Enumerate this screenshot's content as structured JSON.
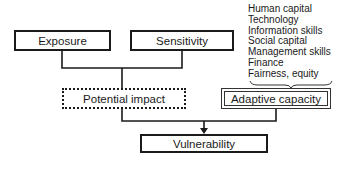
{
  "diagram": {
    "nodes": {
      "exposure": "Exposure",
      "sensitivity": "Sensitivity",
      "potential_impact": "Potential impact",
      "adaptive_capacity": "Adaptive capacity",
      "vulnerability": "Vulnerability"
    },
    "adaptive_capacity_factors": [
      "Human capital",
      "Technology",
      "Information skills",
      "Social capital",
      "Management skills",
      "Finance",
      "Fairness, equity"
    ],
    "edges": [
      {
        "from": "exposure",
        "to": "potential_impact"
      },
      {
        "from": "sensitivity",
        "to": "potential_impact"
      },
      {
        "from": "potential_impact",
        "to": "vulnerability"
      },
      {
        "from": "adaptive_capacity",
        "to": "vulnerability"
      }
    ],
    "colors": {
      "stroke": "#1a1a1a",
      "background": "#ffffff"
    }
  }
}
